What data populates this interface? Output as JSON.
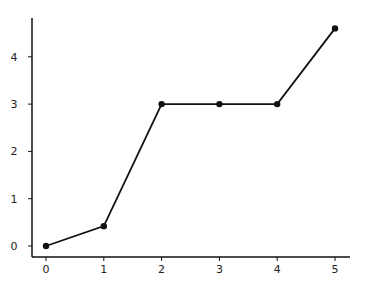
{
  "chart_data": {
    "type": "line",
    "title": "",
    "xlabel": "",
    "ylabel": "",
    "x": [
      0,
      1,
      2,
      3,
      4,
      5
    ],
    "series": [
      {
        "name": "",
        "values": [
          0,
          0.42,
          3,
          3,
          3,
          4.6
        ],
        "color": "#111111",
        "marker": "circle"
      }
    ],
    "x_ticks": [
      "0",
      "1",
      "2",
      "3",
      "4",
      "5"
    ],
    "y_ticks": [
      "0",
      "1",
      "2",
      "3",
      "4"
    ],
    "xlim": [
      -0.25,
      5.25
    ],
    "ylim": [
      -0.22,
      4.65
    ],
    "grid": false,
    "legend": null
  }
}
